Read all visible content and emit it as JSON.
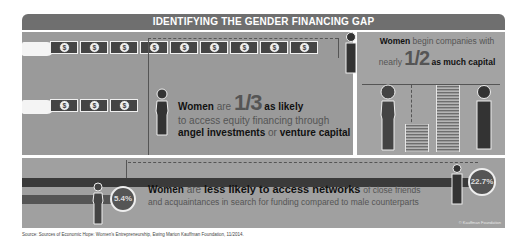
{
  "header": {
    "title": "IDENTIFYING THE GENDER FINANCING GAP"
  },
  "left_panel": {
    "male_bills_count": 9,
    "female_bills_count": 3,
    "bill_symbol": "$",
    "stat_prefix_bold": "Women",
    "stat_prefix": "are",
    "stat_fraction": "1/3",
    "stat_suffix_bold": "as likely",
    "line2": "to access equity financing through",
    "line3_bold1": "angel investments",
    "line3_mid": "or",
    "line3_bold2": "venture capital"
  },
  "right_panel": {
    "line1_bold": "Women",
    "line1": "begin companies with",
    "line2_prefix": "nearly",
    "fraction": "1/2",
    "line2_bold": "as much capital"
  },
  "bottom_panel": {
    "women_percent": "5.4%",
    "men_percent": "22.7%",
    "text_bold1": "Women",
    "text_mid1": "are",
    "text_bold2": "less likely to access networks",
    "text_rest1": "of close friends",
    "text_line2": "and acquaintances in search for funding compared to male counterparts",
    "credit": "© Kauffman Foundation"
  },
  "source": "Source: Sources of Economic Hope: Women's Entrepreneurship, Ewing Marion Kauffman Foundation, 11/2014.",
  "colors": {
    "dark": "#444444",
    "panel": "#9a9a9a",
    "header": "#6f6f6f"
  }
}
